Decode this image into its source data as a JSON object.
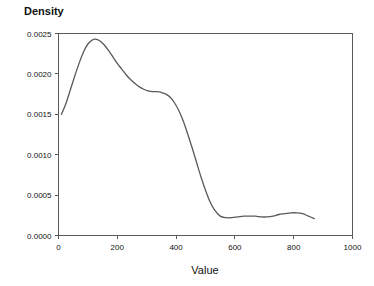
{
  "chart_data": {
    "type": "line",
    "title": "",
    "xlabel": "Value",
    "ylabel": "Density",
    "xlim": [
      0,
      1000
    ],
    "ylim": [
      0.0,
      0.0025
    ],
    "grid": false,
    "legend": null,
    "x_ticks": [
      0,
      200,
      400,
      600,
      800,
      1000
    ],
    "x_tick_labels": [
      "0",
      "200",
      "400",
      "600",
      "800",
      "1000"
    ],
    "y_ticks": [
      0.0,
      0.0005,
      0.001,
      0.0015,
      0.002,
      0.0025
    ],
    "y_tick_labels": [
      "0.0000",
      "0.0005",
      "0.0010",
      "0.0015",
      "0.0020",
      "0.0025"
    ],
    "series": [
      {
        "name": "density",
        "color": "#595959",
        "x": [
          10,
          25,
          40,
          55,
          70,
          85,
          100,
          115,
          125,
          140,
          155,
          170,
          185,
          200,
          215,
          230,
          245,
          260,
          275,
          290,
          305,
          320,
          335,
          350,
          365,
          380,
          395,
          410,
          425,
          440,
          455,
          470,
          485,
          500,
          515,
          530,
          550,
          570,
          590,
          610,
          630,
          650,
          670,
          690,
          710,
          730,
          750,
          770,
          790,
          810,
          830,
          850,
          870
        ],
        "y": [
          0.0015,
          0.00163,
          0.0018,
          0.00197,
          0.00213,
          0.00227,
          0.00237,
          0.00242,
          0.00243,
          0.00241,
          0.00236,
          0.00229,
          0.00221,
          0.00213,
          0.00206,
          0.00199,
          0.00193,
          0.00188,
          0.00184,
          0.00181,
          0.00179,
          0.00178,
          0.00178,
          0.00177,
          0.00175,
          0.00171,
          0.00164,
          0.00154,
          0.00141,
          0.00125,
          0.00108,
          0.0009,
          0.00072,
          0.00056,
          0.00042,
          0.00032,
          0.00024,
          0.00022,
          0.00022,
          0.00023,
          0.00024,
          0.00024,
          0.00024,
          0.00023,
          0.00023,
          0.00024,
          0.00026,
          0.00027,
          0.00028,
          0.00028,
          0.00027,
          0.00024,
          0.00021
        ]
      }
    ]
  },
  "axis": {
    "y_title": "Density",
    "x_title": "Value"
  }
}
